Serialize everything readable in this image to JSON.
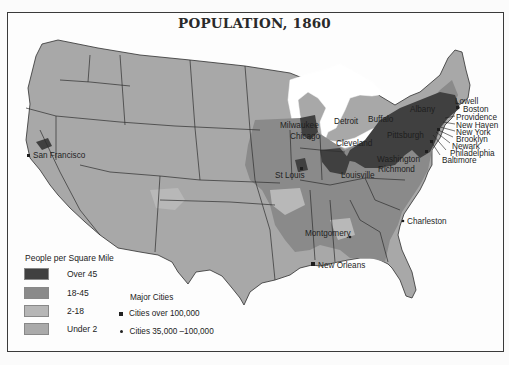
{
  "map": {
    "title": "POPULATION, 1860",
    "density_colors": {
      "over_45": "#404040",
      "18_45": "#8a8a8a",
      "2_18": "#b4b4b4",
      "under_2": "#a9a9a9",
      "water": "#ffffff",
      "border": "#2e2e2e"
    }
  },
  "legend": {
    "title": "People per Square Mile",
    "items": [
      {
        "label": "Over 45",
        "color": "#404040"
      },
      {
        "label": "18-45",
        "color": "#8a8a8a"
      },
      {
        "label": "2-18",
        "color": "#b6b6b6"
      },
      {
        "label": "Under 2",
        "color": "#aaaaaa"
      }
    ]
  },
  "major_cities_legend": {
    "title": "Major Cities",
    "items": [
      {
        "symbol": "square",
        "label": "Cities over 100,000"
      },
      {
        "symbol": "dot",
        "label": "Cities 35,000 –100,000"
      }
    ]
  },
  "cities": [
    {
      "name": "Lowell"
    },
    {
      "name": "Boston"
    },
    {
      "name": "Providence"
    },
    {
      "name": "New Haven"
    },
    {
      "name": "New York"
    },
    {
      "name": "Brooklyn"
    },
    {
      "name": "Newark"
    },
    {
      "name": "Philadelphia"
    },
    {
      "name": "Baltimore"
    },
    {
      "name": "San Francisco"
    },
    {
      "name": "Milwaukee"
    },
    {
      "name": "Chicago"
    },
    {
      "name": "Detroit"
    },
    {
      "name": "Buffalo"
    },
    {
      "name": "Cleveland"
    },
    {
      "name": "Pittsburgh"
    },
    {
      "name": "Albany"
    },
    {
      "name": "Washington"
    },
    {
      "name": "Richmond"
    },
    {
      "name": "Louisville"
    },
    {
      "name": "St Louis"
    },
    {
      "name": "Charleston"
    },
    {
      "name": "Montgomery"
    },
    {
      "name": "New Orleans"
    }
  ]
}
